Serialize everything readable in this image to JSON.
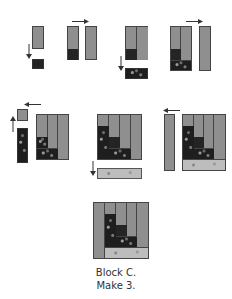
{
  "diagram": {
    "caption_line1": "Block C.",
    "caption_line2": "Make 3.",
    "colors": {
      "gray_fabric": "#8f8f8f",
      "dark_fabric": "#242424",
      "light_fabric": "#bdbdbd",
      "outline": "#444444"
    },
    "steps": [
      {
        "id": 1,
        "arrow": "down",
        "description": "gray rectangle with dark square below"
      },
      {
        "id": 2,
        "arrow": "right",
        "description": "gray/dark unit and gray strip"
      },
      {
        "id": 3,
        "arrow": "down",
        "description": "two-column unit with dark strip below"
      },
      {
        "id": 4,
        "arrow": "right",
        "description": "unit with gray strip at right"
      },
      {
        "id": 5,
        "arrow": "left-up",
        "description": "gray square atop dark strip joined at left"
      },
      {
        "id": 6,
        "arrow": "down",
        "description": "unit with light strip below"
      },
      {
        "id": 7,
        "arrow": "left",
        "description": "gray strip joined at left"
      },
      {
        "id": 8,
        "arrow": "none",
        "description": "finished Block C"
      }
    ]
  }
}
